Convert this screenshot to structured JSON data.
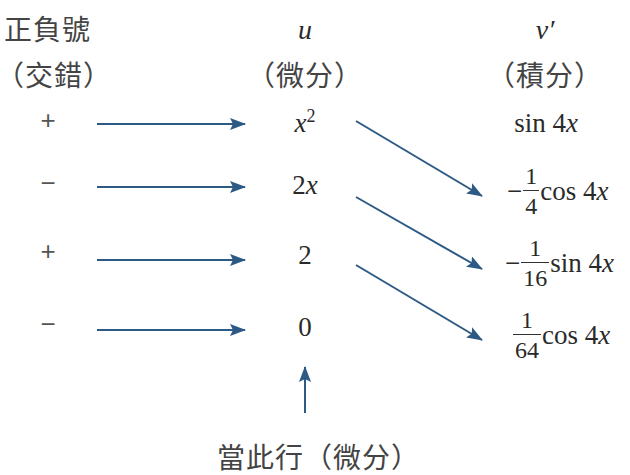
{
  "headers": {
    "sign": {
      "title": "正負號",
      "subtitle": "（交錯）"
    },
    "u": {
      "title": "u",
      "subtitle": "（微分）"
    },
    "v": {
      "title": "v′",
      "subtitle": "（積分）"
    }
  },
  "rows": [
    {
      "sign": "+",
      "u_base": "x",
      "u_sup": "2",
      "v_prefix": "",
      "v_num": "",
      "v_den": "",
      "v_func": "sin 4",
      "v_var": "x"
    },
    {
      "sign": "−",
      "u_coef": "2",
      "u_var": "x",
      "v_prefix": "−",
      "v_num": "1",
      "v_den": "4",
      "v_func": "cos 4",
      "v_var": "x"
    },
    {
      "sign": "+",
      "u_value": "2",
      "v_prefix": "−",
      "v_num": "1",
      "v_den": "16",
      "v_func": "sin 4",
      "v_var": "x"
    },
    {
      "sign": "−",
      "u_value": "0",
      "v_prefix": "",
      "v_num": "1",
      "v_den": "64",
      "v_func": "cos 4",
      "v_var": "x"
    }
  ],
  "footer": {
    "label": "當此行（微分）"
  },
  "colors": {
    "arrow": "#2c5a85",
    "text": "#333333"
  }
}
